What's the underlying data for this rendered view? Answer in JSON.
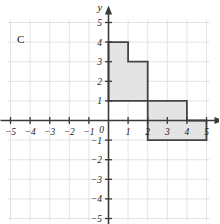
{
  "figure": {
    "label": "C",
    "axis_x_name": "x",
    "axis_y_name": "y"
  },
  "colors": {
    "shape_fill": "#e2e2e2",
    "shape_stroke": "#444444",
    "grid": "#d8d8d8",
    "axis": "#3a3a3a",
    "text": "#1a1a1a",
    "background": "#ffffff"
  },
  "chart_data": {
    "type": "scatter",
    "title": "",
    "subtitle": "",
    "xlabel": "x",
    "ylabel": "y",
    "xlim": [
      -5.6,
      5.6
    ],
    "ylim": [
      -5.4,
      5.6
    ],
    "grid": true,
    "legend": false,
    "legend_position": "none",
    "annotations": [
      {
        "text": "C",
        "position": "top-left-outside"
      }
    ],
    "x_ticks": [
      -5,
      -4,
      -3,
      -2,
      -1,
      0,
      1,
      2,
      3,
      4,
      5
    ],
    "x_tick_labels": [
      "−5",
      "−4",
      "−3",
      "−2",
      "−1",
      "0",
      "1",
      "2",
      "3",
      "4",
      "5"
    ],
    "y_ticks": [
      -5,
      -4,
      -3,
      -2,
      -1,
      1,
      2,
      3,
      4,
      5
    ],
    "y_tick_labels": [
      "−5",
      "−4",
      "−3",
      "−2",
      "−1",
      "1",
      "2",
      "3",
      "4",
      "5"
    ],
    "origin_label": "0",
    "series": [
      {
        "name": "shape-C",
        "type": "polygon",
        "closed": true,
        "fill": "#e2e2e2",
        "stroke": "#444444",
        "vertices": [
          [
            0,
            4
          ],
          [
            1,
            4
          ],
          [
            1,
            3
          ],
          [
            2,
            3
          ],
          [
            2,
            1
          ],
          [
            4,
            1
          ],
          [
            4,
            0
          ],
          [
            5,
            0
          ],
          [
            5,
            -1
          ],
          [
            2,
            -1
          ],
          [
            2,
            1
          ],
          [
            0,
            1
          ]
        ]
      }
    ]
  }
}
